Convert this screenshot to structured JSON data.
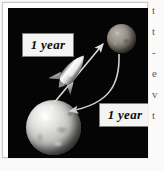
{
  "figure": {
    "caption_labels": {
      "outbound": "1 year",
      "return": "1 year"
    },
    "objects": {
      "origin_planet": "earth-planet",
      "destination_planet": "destination-planet",
      "vehicle": "rocket-ship",
      "outbound_arrow": "outbound-travel-arrow",
      "return_arrow": "return-travel-arrow"
    },
    "colors": {
      "space_background": "#050505",
      "label_background": "#f4f4f2",
      "label_border": "#7e7e7c",
      "label_text": "#0a0a0a",
      "earth_highlight": "#ffffff",
      "destination_planet_body": "#9a948a",
      "arrow_stroke": "#d8d8d6",
      "rocket_body": "#f2f2f0"
    }
  },
  "page_text_sliver": {
    "lines": [
      "t",
      "t",
      "-",
      "e",
      "v",
      "t"
    ]
  }
}
